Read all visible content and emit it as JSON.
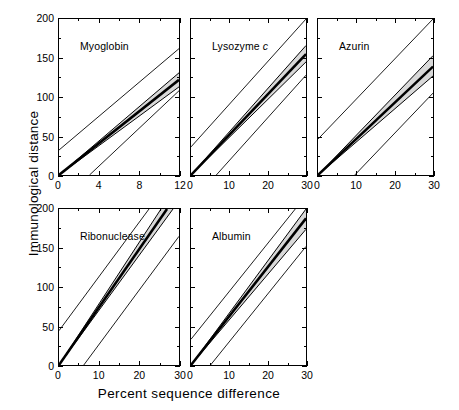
{
  "figure": {
    "xlabel": "Percent sequence difference",
    "ylabel": "Immunological distance",
    "band_color": "#d9d9d9",
    "line_color": "#000000"
  },
  "chart_data": {
    "type": "line",
    "title": "",
    "xlabel": "Percent sequence difference",
    "ylabel": "Immunological distance",
    "grid": false,
    "legend": "none",
    "panel_layout": "3 columns x 2 rows, last cell empty",
    "ylim": [
      0,
      200
    ],
    "yticks": [
      0,
      50,
      100,
      150,
      200
    ],
    "yminorticks": [
      25,
      75,
      125,
      175
    ],
    "panels": [
      {
        "title": "Myoglobin",
        "title_italic_suffix": "",
        "xlim": [
          0,
          12
        ],
        "xticks": [
          0,
          4,
          8,
          12
        ],
        "xminorticks": [
          2,
          6,
          10
        ],
        "series": [
          {
            "name": "upper prediction limit",
            "style": "thin",
            "x": [
              0,
              12
            ],
            "y": [
              32,
              162
            ]
          },
          {
            "name": "confidence band upper",
            "style": "band-edge",
            "x": [
              0,
              12
            ],
            "y": [
              0,
              131
            ]
          },
          {
            "name": "regression line",
            "style": "thick",
            "x": [
              0,
              12
            ],
            "y": [
              0,
              122
            ]
          },
          {
            "name": "confidence band lower",
            "style": "band-edge",
            "x": [
              0,
              12
            ],
            "y": [
              0,
              113
            ]
          },
          {
            "name": "lower prediction limit",
            "style": "thin",
            "x": [
              3.05,
              12
            ],
            "y": [
              0,
              108
            ]
          }
        ]
      },
      {
        "title": "Lysozyme ",
        "title_italic_suffix": "c",
        "xlim": [
          0,
          30
        ],
        "xticks": [
          0,
          10,
          20,
          30
        ],
        "xminorticks": [
          5,
          15,
          25
        ],
        "series": [
          {
            "name": "upper prediction limit",
            "style": "thin",
            "x": [
              0,
              30
            ],
            "y": [
              36,
              200
            ]
          },
          {
            "name": "confidence band upper",
            "style": "band-edge",
            "x": [
              0,
              30
            ],
            "y": [
              0,
              166
            ]
          },
          {
            "name": "regression line",
            "style": "thick",
            "x": [
              0,
              30
            ],
            "y": [
              0,
              155
            ]
          },
          {
            "name": "confidence band lower",
            "style": "band-edge",
            "x": [
              0,
              30
            ],
            "y": [
              0,
              145
            ]
          },
          {
            "name": "lower prediction limit",
            "style": "thin",
            "x": [
              6.6,
              30
            ],
            "y": [
              0,
              128
            ]
          }
        ]
      },
      {
        "title": "Azurin",
        "title_italic_suffix": "",
        "xlim": [
          0,
          30
        ],
        "xticks": [
          0,
          10,
          20,
          30
        ],
        "xminorticks": [
          5,
          15,
          25
        ],
        "series": [
          {
            "name": "upper prediction limit",
            "style": "thin",
            "x": [
              0,
              30
            ],
            "y": [
              46,
              200
            ]
          },
          {
            "name": "confidence band upper",
            "style": "band-edge",
            "x": [
              0,
              30
            ],
            "y": [
              0,
              153
            ]
          },
          {
            "name": "regression line",
            "style": "thick",
            "x": [
              0,
              30
            ],
            "y": [
              0,
              139
            ]
          },
          {
            "name": "confidence band lower",
            "style": "band-edge",
            "x": [
              0,
              30
            ],
            "y": [
              0,
              127
            ]
          },
          {
            "name": "lower prediction limit",
            "style": "thin",
            "x": [
              9.6,
              30
            ],
            "y": [
              0,
              105
            ]
          }
        ]
      },
      {
        "title": "Ribonuclease",
        "title_italic_suffix": "",
        "xlim": [
          0,
          30
        ],
        "xticks": [
          0,
          10,
          20,
          30
        ],
        "xminorticks": [
          5,
          15,
          25
        ],
        "series": [
          {
            "name": "upper prediction limit",
            "style": "thin",
            "x": [
              0,
              22.5
            ],
            "y": [
              44,
              200
            ]
          },
          {
            "name": "confidence band upper",
            "style": "band-edge",
            "x": [
              0,
              25.5
            ],
            "y": [
              0,
              200
            ]
          },
          {
            "name": "regression line",
            "style": "thick",
            "x": [
              0,
              27.0
            ],
            "y": [
              0,
              200
            ]
          },
          {
            "name": "confidence band lower",
            "style": "band-edge",
            "x": [
              0,
              28.5
            ],
            "y": [
              0,
              200
            ]
          },
          {
            "name": "lower prediction limit",
            "style": "thin",
            "x": [
              6.2,
              30
            ],
            "y": [
              0,
              165
            ]
          }
        ]
      },
      {
        "title": "Albumin",
        "title_italic_suffix": "",
        "xlim": [
          0,
          30
        ],
        "xticks": [
          0,
          10,
          20,
          30
        ],
        "xminorticks": [
          5,
          15,
          25
        ],
        "series": [
          {
            "name": "upper prediction limit",
            "style": "thin",
            "x": [
              0,
              27.2
            ],
            "y": [
              33,
              200
            ]
          },
          {
            "name": "confidence band upper",
            "style": "band-edge",
            "x": [
              0,
              30
            ],
            "y": [
              0,
              200
            ]
          },
          {
            "name": "regression line",
            "style": "thick",
            "x": [
              0,
              30
            ],
            "y": [
              0,
              188
            ]
          },
          {
            "name": "confidence band lower",
            "style": "band-edge",
            "x": [
              0,
              30
            ],
            "y": [
              0,
              174
            ]
          },
          {
            "name": "lower prediction limit",
            "style": "thin",
            "x": [
              5.1,
              30
            ],
            "y": [
              0,
              152
            ]
          }
        ]
      }
    ]
  }
}
